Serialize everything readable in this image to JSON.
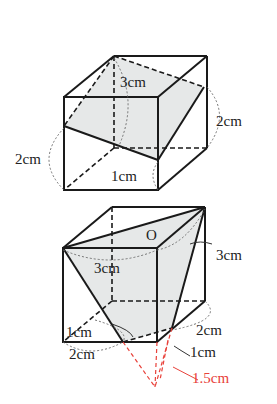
{
  "figure1": {
    "labels": {
      "top": "3cm",
      "right": "2cm",
      "left": "2cm",
      "bottom": "1cm"
    },
    "fill_color": "#e6e8e8",
    "edge_color": "#1a1a1a"
  },
  "figure2": {
    "labels": {
      "apex": "O",
      "inner_left": "3cm",
      "right_top": "3cm",
      "right_mid": "2cm",
      "right_low": "1cm",
      "red_length": "1.5cm",
      "left_inner": "1cm",
      "bottom_left": "2cm"
    },
    "fill_color": "#e6e8e8",
    "edge_color": "#1a1a1a",
    "highlight_color": "#e8413a"
  }
}
